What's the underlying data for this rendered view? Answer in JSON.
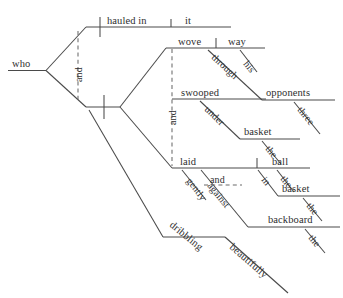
{
  "diagram": {
    "kind": "reed-kellogg-sentence-diagram",
    "sentence": "who hauled in it and wove his way through opponents three, swooped under the basket, and laid the ball in the basket against the backboard gently, dribbling beautifully",
    "line_color": "#4a4a4a",
    "text_color": "#2e2e2e",
    "background": "#ffffff",
    "words": {
      "subject": "who",
      "conj_left": "and",
      "conj_right": "and",
      "pred1_verb": "hauled in",
      "pred1_object": "it",
      "pred2_verb": "wove",
      "pred2_object": "way",
      "pred2_mod_his": "his",
      "pred2_prep": "through",
      "pred2_prep_object": "opponents",
      "pred2_prep_object_mod": "three",
      "pred3_verb": "swooped",
      "pred3_prep": "under",
      "pred3_prep_object": "basket",
      "pred3_prep_object_mod": "the",
      "pred4_verb": "laid",
      "pred4_object": "ball",
      "pred4_object_mod": "the",
      "pred4_adverb": "gently",
      "pred4_conj": "and",
      "pred4_prep1": "in",
      "pred4_prep1_object": "basket",
      "pred4_prep1_object_mod": "the",
      "pred4_prep2": "against",
      "pred4_prep2_object": "backboard",
      "pred4_prep2_object_mod": "the",
      "participle": "dribbling",
      "participle_adverb": "beautifully"
    }
  }
}
